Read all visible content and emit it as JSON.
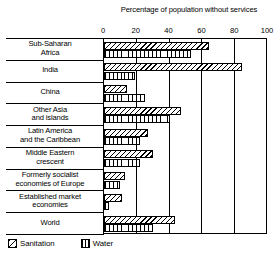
{
  "chart_data": {
    "type": "bar",
    "orientation": "horizontal",
    "title": "Percentage of population without services",
    "xlabel": "",
    "ylabel": "",
    "xlim": [
      0,
      100
    ],
    "xticks": [
      0,
      20,
      40,
      60,
      80,
      100
    ],
    "grid": true,
    "legend_position": "bottom-left",
    "categories": [
      "Sub-Saharan Africa",
      "India",
      "China",
      "Other Asia and islands",
      "Latin America and the Caribbean",
      "Middle Eastern crescent",
      "Formerly socialist economies of Europe",
      "Established market economies",
      "World"
    ],
    "series": [
      {
        "name": "Sanitation",
        "pattern": "diagonal-hatch",
        "values": [
          64,
          84,
          14,
          47,
          27,
          30,
          13,
          11,
          43
        ]
      },
      {
        "name": "Water",
        "pattern": "vertical-hatch",
        "values": [
          53,
          19,
          25,
          40,
          22,
          22,
          10,
          3,
          30
        ]
      }
    ]
  },
  "axis": {
    "tick_labels": [
      "0",
      "20",
      "40",
      "60",
      "80",
      "100"
    ]
  },
  "category_lines": [
    [
      "Sub-Saharan",
      "Africa"
    ],
    [
      "India"
    ],
    [
      "China"
    ],
    [
      "Other Asia",
      "and islands"
    ],
    [
      "Latin America",
      "and the Caribbean"
    ],
    [
      "Middle Eastern",
      "crescent"
    ],
    [
      "Formerly socialist",
      "economies of Europe"
    ],
    [
      "Established market",
      "economies"
    ],
    [
      "World"
    ]
  ],
  "legend": {
    "entries": [
      {
        "label": "Sanitation",
        "icon": "diagonal-hatch-swatch"
      },
      {
        "label": "Water",
        "icon": "vertical-hatch-swatch"
      }
    ]
  },
  "colors": {
    "ink": "#000000",
    "background": "#ffffff"
  }
}
